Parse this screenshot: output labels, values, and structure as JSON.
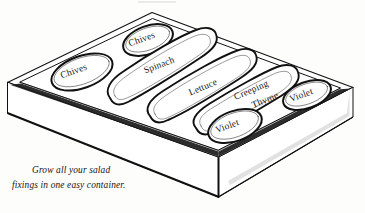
{
  "illustration": {
    "title": "Salad planter box",
    "subject": "rectangular planter container in perspective with seven planting beds",
    "style": "black-and-white pen line drawing",
    "background_color": "#fdfdfc",
    "line_color": "#111111"
  },
  "caption": {
    "line1": "Grow all your salad",
    "line2": "fixings in one easy container.",
    "full_text": "Grow all your salad fixings in one easy container."
  },
  "beds": [
    {
      "id": "bed-chives-left",
      "label": "Chives",
      "shape": "oval",
      "rotation_deg": -17
    },
    {
      "id": "bed-chives-top",
      "label": "Chives",
      "shape": "oval",
      "rotation_deg": -17
    },
    {
      "id": "bed-spinach",
      "label": "Spinach",
      "shape": "long-rounded",
      "rotation_deg": -19
    },
    {
      "id": "bed-lettuce",
      "label": "Lettuce",
      "shape": "long-rounded",
      "rotation_deg": -21
    },
    {
      "id": "bed-creeping-thyme",
      "label": "Creeping",
      "label2": "Thyme",
      "shape": "long-rounded",
      "rotation_deg": -22
    },
    {
      "id": "bed-violet-front",
      "label": "Violet",
      "shape": "oval",
      "rotation_deg": -16
    },
    {
      "id": "bed-violet-right",
      "label": "Violet",
      "shape": "oval",
      "rotation_deg": -17
    }
  ]
}
